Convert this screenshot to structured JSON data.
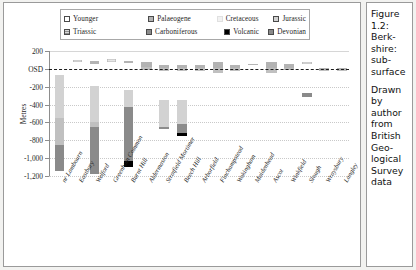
{
  "figure": {
    "caption_title": "Figure 1.2: Berk-shire: sub-surface",
    "caption_source": "Drawn by author from British Geo-logical Survey data"
  },
  "chart_data": {
    "type": "bar",
    "title": "",
    "xlabel": "",
    "ylabel": "Metres",
    "ylim": [
      -1200,
      200
    ],
    "yticks": [
      200,
      0,
      -200,
      -400,
      -600,
      -800,
      -1000,
      -1200
    ],
    "ytick_labels": [
      "200",
      "OSD",
      "-200",
      "-400",
      "-600",
      "-800",
      "-1,000",
      "-1,200"
    ],
    "grid": true,
    "legend_position": "top",
    "stacked": true,
    "datum_line": {
      "value": 0,
      "label": "OSD",
      "style": "dashed"
    },
    "categories": [
      "nr Lambourn",
      "Eastbury",
      "Welford",
      "Greenham Common",
      "Burnt Hill",
      "Aldermaston",
      "Stratfield Mortimer",
      "Beech Hill",
      "Arborfield",
      "Finchampstead",
      "Wokingham",
      "Maidenhead",
      "Ascot",
      "Winkfield",
      "Slough",
      "Wraysbury",
      "Langley"
    ],
    "series": [
      {
        "name": "Younger",
        "color": "#ffffff",
        "hatch": false
      },
      {
        "name": "Palaeogene",
        "color": "#b3b3b3",
        "hatch": false
      },
      {
        "name": "Cretaceous",
        "color": "#e6e6e6",
        "hatch": false
      },
      {
        "name": "Jurassic",
        "color": "#d2d2d2",
        "hatch": false
      },
      {
        "name": "Triassic",
        "color": "#c0c0c0",
        "hatch": true
      },
      {
        "name": "Carboniferous",
        "color": "#8c8c8c",
        "hatch": false
      },
      {
        "name": "Volcanic",
        "color": "#000000",
        "hatch": false
      },
      {
        "name": "Devonian",
        "color": "#8a8a8a",
        "hatch": false
      }
    ],
    "bars": [
      {
        "category": "nr Lambourn",
        "left": 2.0,
        "width": 3.0,
        "segments": [
          {
            "series": "Jurassic",
            "top": -65,
            "bottom": -548
          },
          {
            "series": "Triassic",
            "top": -548,
            "bottom": -852
          },
          {
            "series": "Devonian",
            "top": -852,
            "bottom": -1148
          }
        ]
      },
      {
        "category": "Eastbury",
        "left": 7.9,
        "width": 3.0,
        "segments": [
          {
            "series": "Cretaceous",
            "top": 96,
            "bottom": 82
          }
        ]
      },
      {
        "category": "Welford",
        "left": 13.5,
        "width": 3.0,
        "segments": [
          {
            "series": "Palaeogene",
            "top": 88,
            "bottom": 58
          },
          {
            "series": "Jurassic",
            "top": -190,
            "bottom": -600
          },
          {
            "series": "Triassic",
            "top": -600,
            "bottom": -652
          },
          {
            "series": "Devonian",
            "top": -652,
            "bottom": -1182
          }
        ]
      },
      {
        "category": "Greenham Common",
        "left": 19.3,
        "width": 3.0,
        "segments": [
          {
            "series": "Cretaceous",
            "top": 110,
            "bottom": 76
          }
        ]
      },
      {
        "category": "Burnt Hill",
        "left": 24.9,
        "width": 3.2,
        "segments": [
          {
            "series": "Palaeogene",
            "top": 92,
            "bottom": 62
          },
          {
            "series": "Jurassic",
            "top": -232,
            "bottom": -424
          },
          {
            "series": "Devonian",
            "top": -424,
            "bottom": -1030
          },
          {
            "series": "Volcanic",
            "top": -1030,
            "bottom": -1100
          }
        ]
      },
      {
        "category": "Aldermaston",
        "left": 30.8,
        "width": 3.4,
        "segments": [
          {
            "series": "Palaeogene",
            "top": 76,
            "bottom": 16
          },
          {
            "series": "Triassic",
            "top": 16,
            "bottom": -16
          }
        ]
      },
      {
        "category": "Stratfield Mortimer",
        "left": 36.7,
        "width": 3.4,
        "segments": [
          {
            "series": "Palaeogene",
            "top": 40,
            "bottom": 12
          },
          {
            "series": "Triassic",
            "top": 12,
            "bottom": -22
          },
          {
            "series": "Jurassic",
            "top": -344,
            "bottom": -650
          },
          {
            "series": "Carboniferous",
            "top": -650,
            "bottom": -672
          }
        ]
      },
      {
        "category": "Beech Hill",
        "left": 42.6,
        "width": 3.4,
        "segments": [
          {
            "series": "Palaeogene",
            "top": 38,
            "bottom": 8
          },
          {
            "series": "Triassic",
            "top": 8,
            "bottom": -24
          },
          {
            "series": "Jurassic",
            "top": -352,
            "bottom": -622
          },
          {
            "series": "Carboniferous",
            "top": -622,
            "bottom": -716
          },
          {
            "series": "Volcanic",
            "top": -716,
            "bottom": -748
          }
        ]
      },
      {
        "category": "Arborfield",
        "left": 48.6,
        "width": 3.4,
        "segments": [
          {
            "series": "Palaeogene",
            "top": 48,
            "bottom": 14
          },
          {
            "series": "Triassic",
            "top": 14,
            "bottom": -20
          }
        ]
      },
      {
        "category": "Finchampstead",
        "left": 54.5,
        "width": 3.4,
        "segments": [
          {
            "series": "Palaeogene",
            "top": 72,
            "bottom": 10
          },
          {
            "series": "Triassic",
            "top": 10,
            "bottom": -42
          }
        ]
      },
      {
        "category": "Wokingham",
        "left": 60.4,
        "width": 3.4,
        "segments": [
          {
            "series": "Palaeogene",
            "top": 40,
            "bottom": 8
          },
          {
            "series": "Triassic",
            "top": 8,
            "bottom": -24
          }
        ]
      },
      {
        "category": "Maidenhead",
        "left": 66.4,
        "width": 3.4,
        "segments": [
          {
            "series": "Cretaceous",
            "top": 56,
            "bottom": 44
          }
        ]
      },
      {
        "category": "Ascot",
        "left": 72.3,
        "width": 3.6,
        "segments": [
          {
            "series": "Palaeogene",
            "top": 80,
            "bottom": 8
          },
          {
            "series": "Triassic",
            "top": 8,
            "bottom": -46
          }
        ]
      },
      {
        "category": "Winkfield",
        "left": 78.3,
        "width": 3.4,
        "segments": [
          {
            "series": "Palaeogene",
            "top": 52,
            "bottom": 14
          },
          {
            "series": "Triassic",
            "top": 14,
            "bottom": -14
          }
        ]
      },
      {
        "category": "Slough",
        "left": 84.2,
        "width": 3.4,
        "segments": [
          {
            "series": "Cretaceous",
            "top": 72,
            "bottom": 62
          },
          {
            "series": "Devonian",
            "top": -272,
            "bottom": -310
          }
        ]
      },
      {
        "category": "Wraysbury",
        "left": 90.1,
        "width": 3.4,
        "segments": [
          {
            "series": "Palaeogene",
            "top": 8,
            "bottom": -14
          },
          {
            "series": "Triassic",
            "top": -14,
            "bottom": -28
          }
        ]
      },
      {
        "category": "Langley",
        "left": 96.0,
        "width": 3.4,
        "segments": [
          {
            "series": "Palaeogene",
            "top": 6,
            "bottom": -12
          },
          {
            "series": "Triassic",
            "top": -12,
            "bottom": -26
          }
        ]
      }
    ]
  }
}
